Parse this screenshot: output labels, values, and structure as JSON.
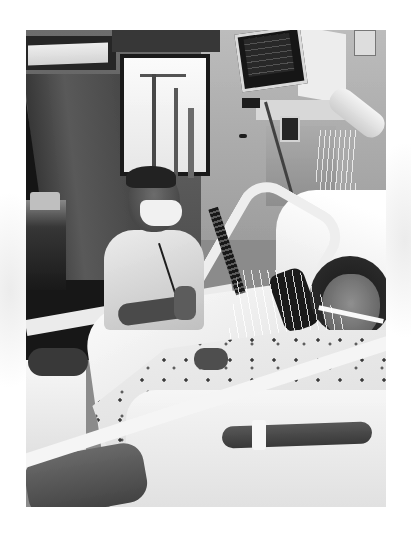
{
  "image": {
    "kind": "black-and-white photograph",
    "subject": "Masked man kneeling beside an intubated woman lying in a hospital bed",
    "frame": {
      "background": "#ffffff",
      "photo_left": 26,
      "photo_top": 30,
      "photo_width": 360,
      "photo_height": 477
    }
  },
  "scene": {
    "regions": [
      {
        "name": "hospital-room-background",
        "description": "Dark doorway on left, window with IV poles, light wall"
      },
      {
        "name": "patient-monitor",
        "description": "Mounted monitor at top center-right"
      },
      {
        "name": "medical-equipment",
        "description": "Articulated arm, IV pump, tubing and wires"
      },
      {
        "name": "visitor",
        "description": "Man in surgical mask and light shirt, hands clasped, lanyard"
      },
      {
        "name": "patient",
        "description": "Woman with dark hair, endotracheal tube, patterned hospital gown, wrist restraint"
      },
      {
        "name": "hospital-bed",
        "description": "White sheets, pillows, bed rails"
      }
    ],
    "palette": {
      "white": "#ffffff",
      "light_gray": "#e6e6e6",
      "mid_gray": "#8a8a8a",
      "dark_gray": "#3a3a3a",
      "black": "#1a1a1a"
    }
  }
}
